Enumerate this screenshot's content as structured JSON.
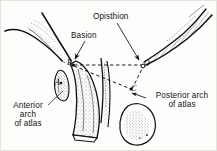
{
  "figure": {
    "kind": "anatomical-line-drawing",
    "background_color": "#fdfdfc",
    "ink_color": "#131313",
    "border_color": "#e3e3e0"
  },
  "annotations": {
    "opisthion": "Opisthion",
    "basion": "Basion",
    "anterior_arch": "Anterior\narch\nof atlas",
    "posterior_arch": "Posterior arch\nof atlas"
  },
  "landmarks": {
    "basion_marker": "B",
    "opisthion_marker": "O",
    "posterior_arch_marker": "C",
    "anterior_arch_marker": "A"
  },
  "measurement_lines": {
    "basion_to_opisthion": "B-O",
    "basion_to_posterior_arch": "C-B",
    "posterior_arch_to_opisthion": "C-O",
    "style": "dashed"
  }
}
